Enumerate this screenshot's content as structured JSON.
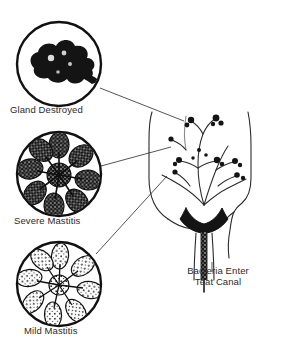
{
  "figure": {
    "background_color": "#ffffff",
    "ink_color": "#1a1a1a",
    "text_color": "#2b2b2b"
  },
  "callouts": [
    {
      "id": "gland-destroyed",
      "label": "Gland Destroyed",
      "severity": "destroyed",
      "fill": "solid-black",
      "circle": {
        "cx": 59,
        "cy": 64,
        "r": 42
      },
      "marker": {
        "cx": 190,
        "cy": 122,
        "r": 6
      }
    },
    {
      "id": "severe-mastitis",
      "label": "Severe Mastitis",
      "severity": "severe",
      "fill": "dark-stipple",
      "circle": {
        "cx": 59,
        "cy": 174,
        "r": 42
      },
      "marker": {
        "cx": 177,
        "cy": 148,
        "r": 6
      }
    },
    {
      "id": "mild-mastitis",
      "label": "Mild Mastitis",
      "severity": "mild",
      "fill": "light-outline",
      "circle": {
        "cx": 59,
        "cy": 284,
        "r": 42
      },
      "marker": {
        "cx": 172,
        "cy": 172,
        "r": 6
      }
    }
  ],
  "teat_label": {
    "id": "bacteria-enter-teat-canal",
    "line1": "Bacteria Enter",
    "line2": "Teat Canal"
  },
  "udder": {
    "name": "udder-cross-section",
    "teat_canal": "stippled bacteria column"
  }
}
